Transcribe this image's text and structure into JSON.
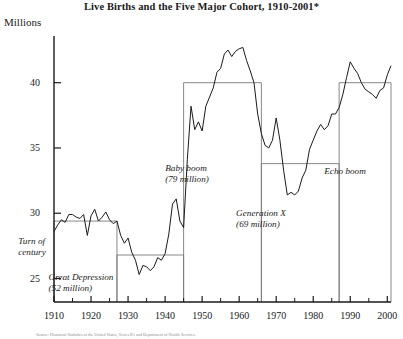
{
  "figure": {
    "title": "Live Births and the Five Major Cohort, 1910-2001*",
    "y_axis_label": "Millions",
    "source_note": "Source: Historical Statistics of the United States, Series B1 and Department of Health Services."
  },
  "axis": {
    "y_ticks": [
      25,
      30,
      35,
      40
    ],
    "y_min": 23.2,
    "y_max": 43.5,
    "x_ticks": [
      1910,
      1920,
      1930,
      1940,
      1950,
      1960,
      1970,
      1980,
      1990,
      2000
    ],
    "x_minor_step": 5,
    "x_min": 1910,
    "x_max": 2001
  },
  "cohorts": [
    {
      "name": "turn-of-century",
      "label_lines": [
        "Turn of",
        "century"
      ],
      "start": 1910,
      "end": 1927,
      "bracket_value": 29.4,
      "label_x": 32,
      "label_y": 236
    },
    {
      "name": "great-depression",
      "label_lines": [
        "Great Depression",
        "(52 million)"
      ],
      "start": 1927,
      "end": 1945,
      "bracket_value": 26.8,
      "label_x": 81,
      "label_y": 272
    },
    {
      "name": "baby-boom",
      "label_lines": [
        "Baby boom",
        "(79 million)"
      ],
      "start": 1945,
      "end": 1966,
      "bracket_value": 40.0,
      "label_x": 187,
      "label_y": 163
    },
    {
      "name": "generation-x",
      "label_lines": [
        "Generation X",
        "(69 million)"
      ],
      "start": 1966,
      "end": 1987,
      "bracket_value": 33.8,
      "label_x": 261,
      "label_y": 208
    },
    {
      "name": "echo-boom",
      "label_lines": [
        "Echo boom"
      ],
      "start": 1987,
      "end": 2001,
      "bracket_value": 40.0,
      "label_x": 345,
      "label_y": 166
    }
  ],
  "colors": {
    "line": "#1a1a1a",
    "axis": "#1a1a1a",
    "bracket": "#7a7a7a",
    "background": "#ffffff"
  },
  "chart_data": {
    "type": "line",
    "title": "Live Births and the Five Major Cohort, 1910-2001*",
    "xlabel": "",
    "ylabel": "Millions",
    "xlim": [
      1910,
      2001
    ],
    "ylim": [
      23.2,
      43.5
    ],
    "grid": false,
    "legend": "none",
    "x": [
      1910,
      1911,
      1912,
      1913,
      1914,
      1915,
      1916,
      1917,
      1918,
      1919,
      1920,
      1921,
      1922,
      1923,
      1924,
      1925,
      1926,
      1927,
      1928,
      1929,
      1930,
      1931,
      1932,
      1933,
      1934,
      1935,
      1936,
      1937,
      1938,
      1939,
      1940,
      1941,
      1942,
      1943,
      1944,
      1945,
      1946,
      1947,
      1948,
      1949,
      1950,
      1951,
      1952,
      1953,
      1954,
      1955,
      1956,
      1957,
      1958,
      1959,
      1960,
      1961,
      1962,
      1963,
      1964,
      1965,
      1966,
      1967,
      1968,
      1969,
      1970,
      1971,
      1972,
      1973,
      1974,
      1975,
      1976,
      1977,
      1978,
      1979,
      1980,
      1981,
      1982,
      1983,
      1984,
      1985,
      1986,
      1987,
      1988,
      1989,
      1990,
      1991,
      1992,
      1993,
      1994,
      1995,
      1996,
      1997,
      1998,
      1999,
      2000,
      2001
    ],
    "series": [
      {
        "name": "Live births (millions)",
        "values": [
          28.6,
          29.1,
          29.5,
          29.3,
          29.9,
          29.9,
          29.7,
          29.6,
          29.9,
          28.3,
          29.8,
          30.3,
          29.4,
          29.7,
          30.1,
          29.5,
          29.2,
          29.4,
          28.3,
          27.7,
          28.1,
          27.0,
          26.4,
          25.3,
          26.0,
          25.9,
          25.6,
          25.9,
          26.6,
          26.4,
          26.9,
          28.4,
          30.7,
          31.1,
          29.4,
          28.9,
          34.1,
          38.2,
          36.4,
          37.0,
          36.3,
          38.2,
          38.9,
          39.6,
          40.8,
          41.1,
          42.2,
          42.5,
          42.0,
          42.4,
          42.6,
          42.7,
          41.7,
          40.9,
          40.0,
          37.6,
          36.1,
          35.2,
          35.0,
          35.6,
          37.3,
          35.6,
          33.3,
          31.4,
          31.6,
          31.4,
          31.7,
          32.7,
          33.3,
          34.9,
          35.6,
          36.3,
          36.8,
          36.4,
          36.7,
          37.6,
          37.6,
          38.1,
          39.1,
          40.4,
          41.6,
          41.1,
          40.7,
          40.0,
          39.5,
          39.3,
          39.1,
          38.8,
          39.4,
          39.6,
          40.6,
          41.3
        ]
      }
    ]
  }
}
